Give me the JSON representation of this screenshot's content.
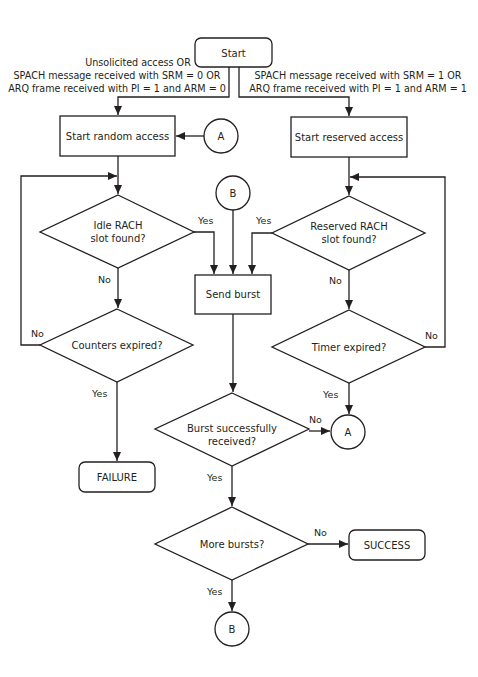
{
  "nodes": {
    "start": {
      "label": "Start",
      "type": "terminal"
    },
    "start_random_access": {
      "label": "Start random access",
      "type": "process"
    },
    "start_reserved_access": {
      "label": "Start reserved access",
      "type": "process"
    },
    "idle_rach": {
      "line1": "Idle RACH",
      "line2": "slot found?",
      "type": "decision"
    },
    "reserved_rach": {
      "line1": "Reserved RACH",
      "line2": "slot found?",
      "type": "decision"
    },
    "send_burst": {
      "label": "Send burst",
      "type": "process"
    },
    "counters_expired": {
      "label": "Counters expired?",
      "type": "decision"
    },
    "timer_expired": {
      "label": "Timer expired?",
      "type": "decision"
    },
    "burst_received": {
      "line1": "Burst successfully",
      "line2": "received?",
      "type": "decision"
    },
    "failure": {
      "label": "FAILURE",
      "type": "terminal"
    },
    "more_bursts": {
      "label": "More bursts?",
      "type": "decision"
    },
    "success": {
      "label": "SUCCESS",
      "type": "terminal"
    },
    "connector_a_top": {
      "label": "A",
      "type": "connector"
    },
    "connector_b_top": {
      "label": "B",
      "type": "connector"
    },
    "connector_a_bottom": {
      "label": "A",
      "type": "connector"
    },
    "connector_b_bottom": {
      "label": "B",
      "type": "connector"
    }
  },
  "conditions": {
    "random": {
      "line1": "Unsolicited access OR",
      "line2": "SPACH message received with SRM = 0 OR",
      "line3": "ARQ frame received with PI = 1 and ARM = 0"
    },
    "reserved": {
      "line1": "SPACH message received with SRM = 1 OR",
      "line2": "ARQ frame received with PI = 1 and ARM = 1"
    }
  },
  "edge_labels": {
    "idle_yes": "Yes",
    "idle_no": "No",
    "reserved_yes": "Yes",
    "reserved_no": "No",
    "counters_no": "No",
    "counters_yes": "Yes",
    "timer_no": "No",
    "timer_yes": "Yes",
    "burst_no": "No",
    "burst_yes": "Yes",
    "more_no": "No",
    "more_yes": "Yes"
  },
  "colors": {
    "stroke": "#231f20",
    "background": "#ffffff"
  }
}
